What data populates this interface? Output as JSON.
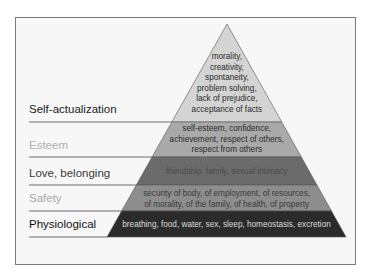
{
  "frame": {
    "x": 15,
    "y": 17,
    "w": 341,
    "h": 248
  },
  "pyramid": {
    "apex": {
      "x": 227,
      "y": 24
    },
    "base_y": 237,
    "base_left": 107,
    "base_right": 346
  },
  "levels": [
    {
      "name": "Self-actualization",
      "label_color": "#222222",
      "fill": "#d4d4d4",
      "text_color": "#2a2a2a",
      "top": 24,
      "bottom": 122,
      "label_y": 117,
      "description": [
        "morality,",
        "creativity,",
        "spontaneity,",
        "problem solving,",
        "lack of prejudice,",
        "acceptance of facts"
      ],
      "desc_start_y": 59
    },
    {
      "name": "Esteem",
      "label_color": "#b0b0b0",
      "fill": "#a9a9a9",
      "text_color": "#2a2a2a",
      "top": 122,
      "bottom": 157,
      "label_y": 153,
      "description": [
        "self-esteem, confidence,",
        "achievement, respect of others,",
        "respect from others"
      ],
      "desc_start_y": 131
    },
    {
      "name": "Love, belonging",
      "label_color": "#3a3a3a",
      "fill": "#6b6b6b",
      "text_color": "#4a4a4a",
      "top": 157,
      "bottom": 185,
      "label_y": 181,
      "description": [
        "friendship, family, sexual intimacy"
      ],
      "desc_start_y": 174
    },
    {
      "name": "Safety",
      "label_color": "#a8a8a8",
      "fill": "#8d8d8d",
      "text_color": "#3a3a3a",
      "top": 185,
      "bottom": 211,
      "label_y": 206,
      "description": [
        "security of body, of employment, of resources,",
        "of morality, of the family, of health, of property"
      ],
      "desc_start_y": 196
    },
    {
      "name": "Physiological",
      "label_color": "#111111",
      "fill": "#2b2b2b",
      "text_color": "#dcdcdc",
      "top": 211,
      "bottom": 237,
      "label_y": 232,
      "description": [
        "breathing, food, water, sex, sleep, homeostasis, excretion"
      ],
      "desc_start_y": 227
    }
  ],
  "label_x": 29,
  "line_color": "#6e6e6e"
}
